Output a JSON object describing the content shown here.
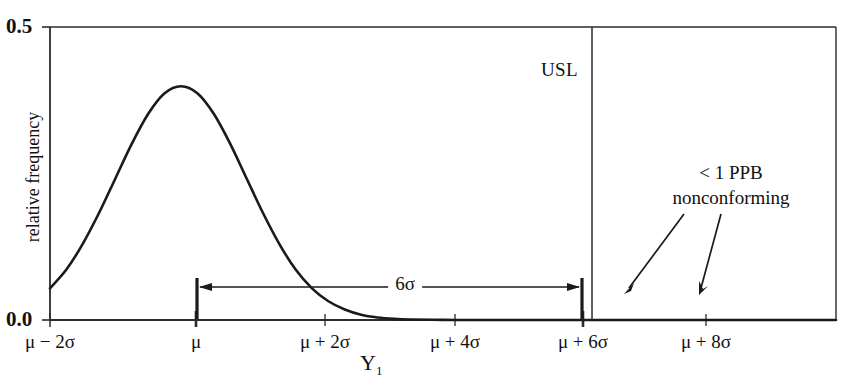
{
  "chart_data": {
    "type": "line",
    "title": "",
    "subtitle": "",
    "xlabel": "Y₁",
    "ylabel": "relative frequency",
    "xlim": [
      -2,
      10
    ],
    "ylim": [
      0.0,
      0.5
    ],
    "grid": false,
    "legend_position": "none",
    "y_ticks": [
      "0.0",
      "0.5"
    ],
    "y_tick_values": [
      0.0,
      0.5
    ],
    "x_ticks": [
      {
        "label": "μ − 2σ",
        "value": -2
      },
      {
        "label": "μ",
        "value": 0
      },
      {
        "label": "μ + 2σ",
        "value": 2
      },
      {
        "label": "μ + 4σ",
        "value": 4
      },
      {
        "label": "μ + 6σ",
        "value": 6
      },
      {
        "label": "μ + 8σ",
        "value": 8
      }
    ],
    "series": [
      {
        "name": "normal density",
        "description": "standard normal probability density, peak 0.40 at μ",
        "x": [
          -2.0,
          -1.75,
          -1.5,
          -1.25,
          -1.0,
          -0.75,
          -0.5,
          -0.25,
          0.0,
          0.25,
          0.5,
          0.75,
          1.0,
          1.25,
          1.5,
          1.75,
          2.0,
          2.25,
          2.5,
          2.75,
          3.0,
          3.25,
          3.5,
          4.0,
          4.5,
          5.0,
          5.5,
          6.0,
          7.0,
          8.0,
          9.0,
          10.0
        ],
        "y": [
          0.054,
          0.086,
          0.13,
          0.183,
          0.242,
          0.301,
          0.352,
          0.387,
          0.399,
          0.387,
          0.352,
          0.301,
          0.242,
          0.183,
          0.13,
          0.086,
          0.054,
          0.032,
          0.018,
          0.0091,
          0.0044,
          0.002,
          0.00087,
          0.00013,
          1.6e-05,
          1.5e-06,
          0.0,
          0.0,
          0.0,
          0.0,
          0.0,
          0.0
        ]
      }
    ],
    "annotations": [
      {
        "name": "usl-line",
        "label": "USL",
        "x": 6.2,
        "type": "vertical-line"
      },
      {
        "name": "six-sigma-span",
        "label": "6σ",
        "from_x": 0,
        "to_x": 6,
        "y": 0.035,
        "type": "double-arrow"
      },
      {
        "name": "nonconforming-note",
        "line1": "< 1 PPB",
        "line2": "nonconforming",
        "type": "text-with-arrows",
        "arrow_count": 2
      }
    ]
  },
  "axes": {
    "y_top_label": "0.5",
    "y_bottom_label": "0.0",
    "y_axis_title": "relative frequency",
    "x_axis_title": "Y",
    "x_axis_title_sub": "1",
    "x_tick_labels": [
      "μ − 2σ",
      "μ",
      "μ + 2σ",
      "μ + 4σ",
      "μ + 6σ",
      "μ + 8σ"
    ]
  },
  "markers": {
    "usl_label": "USL",
    "sigma_span_label": "6σ",
    "nonconforming_line1": "< 1 PPB",
    "nonconforming_line2": "nonconforming"
  },
  "colors": {
    "curve": "#1a1a1a",
    "axis": "#1a1a1a",
    "background": "#ffffff",
    "text": "#111111"
  }
}
